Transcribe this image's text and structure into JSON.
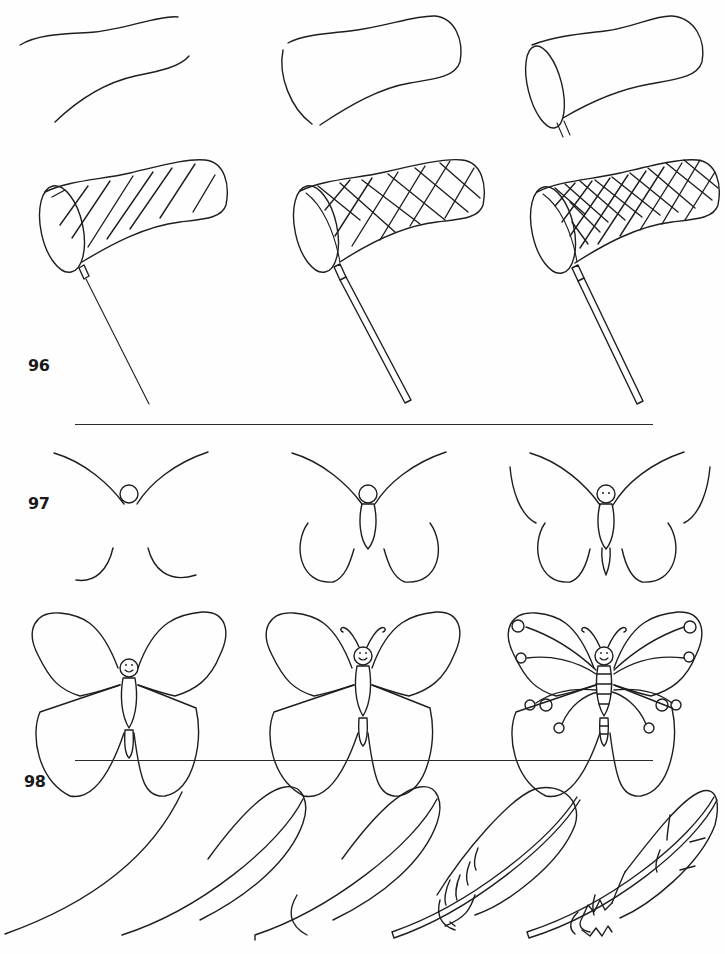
{
  "page": {
    "type": "how-to-draw step-by-step instructional page",
    "ink_color": "#1e1e1e",
    "background": "#fefefe"
  },
  "sections": [
    {
      "number": "96",
      "subject": "butterfly net",
      "steps": 6,
      "step_descriptions": [
        "two wavy parallel curves",
        "closed rounded end and open mouth curves",
        "oval rim with handle start",
        "diagonal net lines and thin handle",
        "crosshatched net and double-line handle",
        "dense crosshatched net and double-line handle"
      ]
    },
    {
      "number": "97",
      "subject": "butterfly",
      "steps": 6,
      "step_descriptions": [
        "head circle with upper wing arcs and lower wing hooks",
        "body added and lower wings extended",
        "eyes, tail and outer upper wing edges",
        "closed wing outlines with smiling face",
        "curled antennae added",
        "wing veins, spots and segmented body"
      ]
    },
    {
      "number": "98",
      "subject": "feather",
      "steps": 5,
      "step_descriptions": [
        "single long curve",
        "feather outline with shaft",
        "base curve added",
        "double-line shaft and barb strokes",
        "jagged barbs and detail strokes"
      ]
    }
  ],
  "dividers": [
    {
      "after_section": "96"
    },
    {
      "after_section": "97"
    }
  ]
}
